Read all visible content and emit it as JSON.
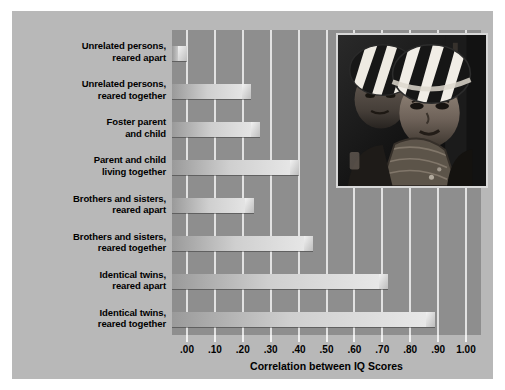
{
  "chart_data": {
    "type": "bar",
    "orientation": "horizontal",
    "title": "",
    "xlabel": "Correlation between IQ Scores",
    "ylabel": "",
    "xlim": [
      0.0,
      1.0
    ],
    "grid": true,
    "legend": false,
    "tick_labels": [
      ".00",
      ".10",
      ".20",
      ".30",
      ".40",
      ".50",
      ".60",
      ".70",
      ".80",
      ".90",
      "1.00"
    ],
    "tick_values": [
      0.0,
      0.1,
      0.2,
      0.3,
      0.4,
      0.5,
      0.6,
      0.7,
      0.8,
      0.9,
      1.0
    ],
    "categories": [
      "Unrelated persons, reared apart",
      "Unrelated persons, reared together",
      "Foster parent and child",
      "Parent and child living together",
      "Brothers and sisters, reared apart",
      "Brothers and sisters, reared together",
      "Identical twins, reared apart",
      "Identical twins, reared together"
    ],
    "values": [
      0.0,
      0.23,
      0.26,
      0.4,
      0.24,
      0.45,
      0.72,
      0.89
    ]
  },
  "categories_wrapped": [
    {
      "line1": "Unrelated persons,",
      "line2": "reared apart"
    },
    {
      "line1": "Unrelated persons,",
      "line2": "reared together"
    },
    {
      "line1": "Foster parent",
      "line2": "and child"
    },
    {
      "line1": "Parent and child",
      "line2": "living together"
    },
    {
      "line1": "Brothers and sisters,",
      "line2": "reared apart"
    },
    {
      "line1": "Brothers and sisters,",
      "line2": "reared together"
    },
    {
      "line1": "Identical twins,",
      "line2": "reared apart"
    },
    {
      "line1": "Identical twins,",
      "line2": "reared together"
    }
  ],
  "photo": {
    "caption": "",
    "alt_name": "twin-children-photo"
  },
  "colors": {
    "panel_background": "#b8b8b8",
    "plot_background": "#8e8e8e",
    "gridline": "#e2e2e2",
    "bar_light": "#e9e9e9",
    "bar_dark": "#9a9a9a",
    "text": "#000000"
  }
}
